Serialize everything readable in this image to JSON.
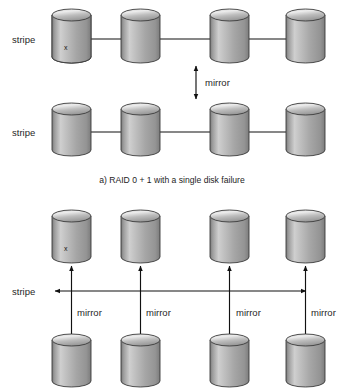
{
  "figure": {
    "title_caption_a": "a) RAID 0 + 1 with a single disk failure",
    "failure_marker": "x",
    "panels": [
      {
        "id": "panel-a",
        "caption": "a) RAID 0 + 1 with a single disk failure",
        "rows": [
          {
            "label": "stripe",
            "disks": 4,
            "failed_disk_index": 0,
            "stripe_arrow": "bidirectional-horizontal"
          },
          {
            "label": "stripe",
            "disks": 4,
            "failed_disk_index": null,
            "stripe_arrow": "bidirectional-horizontal"
          }
        ],
        "between_rows_label": "mirror",
        "between_rows_arrow": "bidirectional-vertical"
      },
      {
        "id": "panel-b",
        "caption": "",
        "rows": [
          {
            "label": "",
            "disks": 4,
            "failed_disk_index": 0,
            "stripe_arrow": null
          },
          {
            "label": "",
            "disks": 4,
            "failed_disk_index": null,
            "stripe_arrow": null
          }
        ],
        "stripe_label": "stripe",
        "mirror_labels": [
          "mirror",
          "mirror",
          "mirror",
          "mirror"
        ],
        "mirror_arrow": "bidirectional-vertical"
      }
    ]
  },
  "colors": {
    "background": "#ffffff",
    "disk_dark": "#6f6f6f",
    "disk_mid": "#a9a9a9",
    "disk_light": "#d8d8d8",
    "disk_top_light": "#e6e6e6",
    "disk_top_dark": "#8c8c8c",
    "outline": "#3b3b3b",
    "arrow": "#111111",
    "text": "#1f1f1f"
  },
  "geometry": {
    "disk_width": 39,
    "disk_body_height": 42,
    "ellipse_ry": 6,
    "columns_x": [
      52,
      121,
      210,
      286
    ],
    "panel_a_row1_top_y": 9,
    "panel_a_row2_top_y": 103,
    "panel_b_row1_top_y": 210,
    "panel_b_row2_top_y": 334
  }
}
